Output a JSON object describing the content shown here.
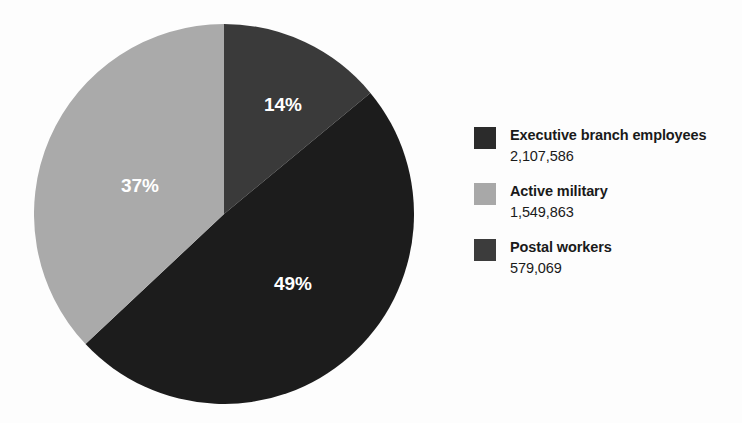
{
  "chart_data": {
    "type": "pie",
    "title": "",
    "labels": [
      "Executive branch employees",
      "Active military",
      "Postal workers"
    ],
    "values": [
      2107586,
      1549863,
      579069
    ],
    "value_labels": [
      "2,107,586",
      "1,549,863",
      "579,069"
    ],
    "percent_labels": [
      "49%",
      "37%",
      "14%"
    ],
    "percents": [
      49,
      37,
      14
    ],
    "colors": [
      "#1c1c1c",
      "#aaaaaa",
      "#3a3a3a"
    ],
    "legend_position": "right",
    "grid": false,
    "start_angle_deg": 0,
    "direction": "clockwise",
    "slice_order_from_twelve_oclock": [
      "Postal workers",
      "Executive branch employees",
      "Active military"
    ],
    "slices": [
      {
        "name": "Postal workers",
        "percent_label": "14%",
        "percent": 14,
        "value": 579069,
        "value_label": "579,069",
        "color": "#3a3a3a",
        "start_deg": 0,
        "end_deg": 50.4,
        "label_x": 283,
        "label_y": 106
      },
      {
        "name": "Executive branch employees",
        "percent_label": "49%",
        "percent": 49,
        "value": 2107586,
        "value_label": "2,107,586",
        "color": "#1c1c1c",
        "start_deg": 50.4,
        "end_deg": 226.8,
        "label_x": 293,
        "label_y": 285
      },
      {
        "name": "Active military",
        "percent_label": "37%",
        "percent": 37,
        "value": 1549863,
        "value_label": "1,549,863",
        "color": "#aaaaaa",
        "start_deg": 226.8,
        "end_deg": 360,
        "label_x": 140,
        "label_y": 187
      }
    ]
  },
  "legend": {
    "items": [
      {
        "label": "Executive branch employees",
        "value": "2,107,586",
        "color": "#2b2b2b"
      },
      {
        "label": "Active military",
        "value": "1,549,863",
        "color": "#a8a8a8"
      },
      {
        "label": "Postal workers",
        "value": "579,069",
        "color": "#3c3c3c"
      }
    ]
  }
}
